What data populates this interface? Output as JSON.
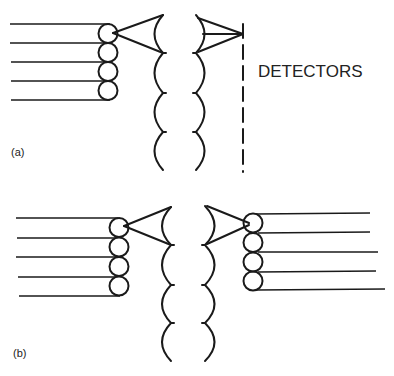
{
  "figure": {
    "panel_a": {
      "label": "(a)",
      "detector_label": "DETECTORS",
      "fiber_count": 5
    },
    "panel_b": {
      "label": "(b)",
      "input_fiber_count": 5,
      "output_fiber_count": 5
    }
  },
  "colors": {
    "ink": "#1a1a1a",
    "background": "#ffffff"
  }
}
